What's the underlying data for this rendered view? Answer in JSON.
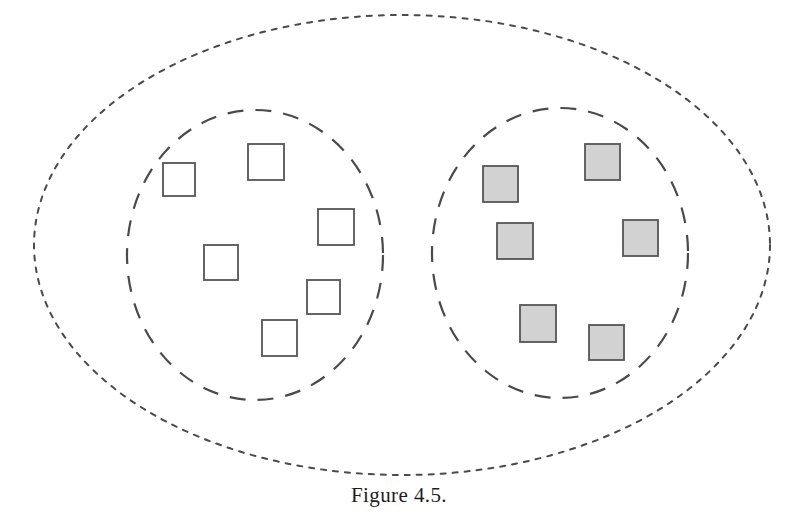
{
  "figure": {
    "caption": "Figure 4.5.",
    "type": "venn-like set diagram",
    "background_color": "#ffffff",
    "stroke_color": "#4a4a4a",
    "universe": {
      "name": "outer-universe-ellipse",
      "style": "dotted",
      "cx": 402,
      "cy": 245,
      "rx": 368,
      "ry": 230,
      "dash": "5 7",
      "stroke_width": 2.0
    },
    "sets": [
      {
        "name": "left-set-circle",
        "style": "dashed",
        "cx": 255,
        "cy": 255,
        "rx": 128,
        "ry": 145,
        "dash": "16 12",
        "stroke_width": 2.2,
        "fill_label": "unfilled",
        "member_fill": "#ffffff",
        "member_stroke": "#555555",
        "member_count": 6,
        "members": [
          {
            "label": "white-square-1",
            "x": 163,
            "y": 163,
            "w": 32,
            "h": 33
          },
          {
            "label": "white-square-2",
            "x": 248,
            "y": 144,
            "w": 36,
            "h": 36
          },
          {
            "label": "white-square-3",
            "x": 318,
            "y": 209,
            "w": 36,
            "h": 36
          },
          {
            "label": "white-square-4",
            "x": 204,
            "y": 245,
            "w": 34,
            "h": 35
          },
          {
            "label": "white-square-5",
            "x": 307,
            "y": 280,
            "w": 33,
            "h": 34
          },
          {
            "label": "white-square-6",
            "x": 262,
            "y": 320,
            "w": 35,
            "h": 36
          }
        ]
      },
      {
        "name": "right-set-circle",
        "style": "dashed",
        "cx": 560,
        "cy": 253,
        "rx": 128,
        "ry": 145,
        "dash": "16 12",
        "stroke_width": 2.2,
        "fill_label": "shaded",
        "member_fill": "#d2d2d2",
        "member_stroke": "#555555",
        "member_count": 6,
        "members": [
          {
            "label": "gray-square-1",
            "x": 483,
            "y": 166,
            "w": 35,
            "h": 36
          },
          {
            "label": "gray-square-2",
            "x": 585,
            "y": 144,
            "w": 35,
            "h": 36
          },
          {
            "label": "gray-square-3",
            "x": 497,
            "y": 223,
            "w": 36,
            "h": 36
          },
          {
            "label": "gray-square-4",
            "x": 623,
            "y": 220,
            "w": 35,
            "h": 36
          },
          {
            "label": "gray-square-5",
            "x": 520,
            "y": 305,
            "w": 36,
            "h": 37
          },
          {
            "label": "gray-square-6",
            "x": 589,
            "y": 325,
            "w": 35,
            "h": 35
          }
        ]
      }
    ]
  }
}
